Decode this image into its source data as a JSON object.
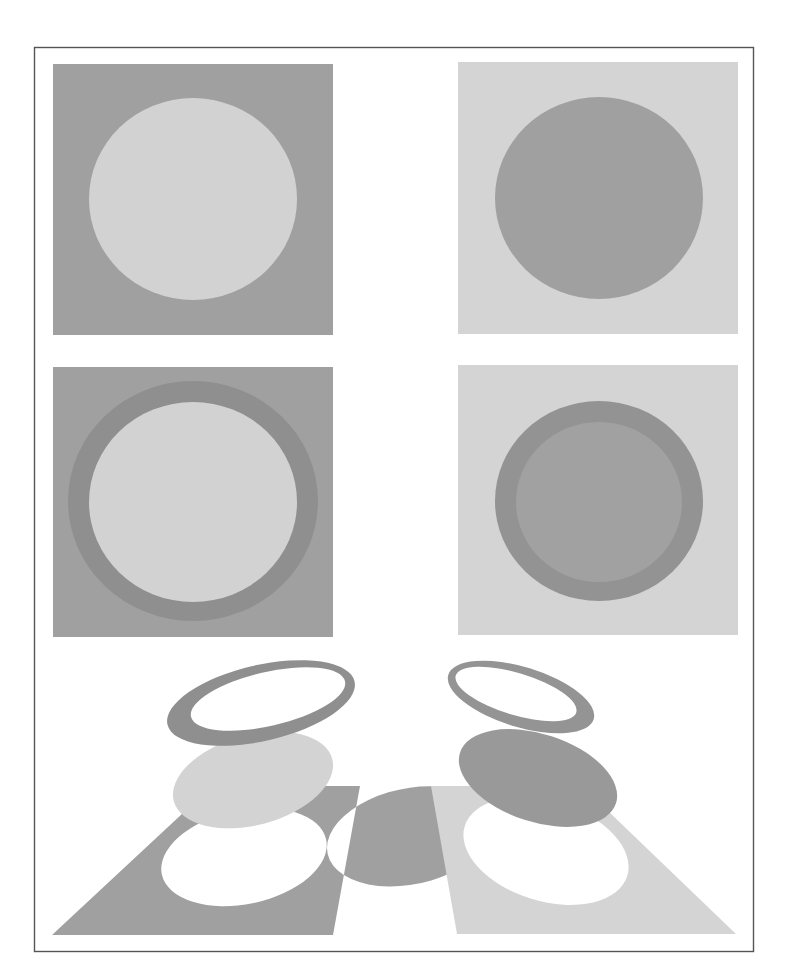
{
  "figure": {
    "colors": {
      "background": "#ffffff",
      "frame": "#555555",
      "dark_gray": "#a0a0a0",
      "light_gray": "#d3d3d3",
      "ring_dark": "#8f8f8f",
      "ring_right": "#949494",
      "hole": "#ffffff"
    },
    "panels": [
      {
        "id": "top-left",
        "label": "light disc on dark square",
        "background": "dark",
        "disc": "light",
        "ring": false
      },
      {
        "id": "top-right",
        "label": "dark disc on light square",
        "background": "light",
        "disc": "dark",
        "ring": false
      },
      {
        "id": "middle-left",
        "label": "light disc with dark ring on dark square",
        "background": "dark",
        "disc": "light",
        "ring": true
      },
      {
        "id": "middle-right",
        "label": "dark disc with darker ring on light square",
        "background": "light",
        "disc": "dark",
        "ring": true
      }
    ],
    "exploded_views": [
      {
        "id": "bottom-left",
        "label": "exploded view: dark ring, light disc, dark base with hole"
      },
      {
        "id": "bottom-right",
        "label": "exploded view: dark ring, dark disc, light base with hole"
      }
    ]
  }
}
